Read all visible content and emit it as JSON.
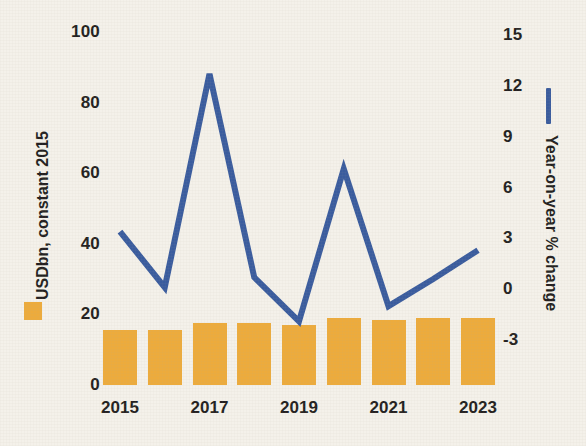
{
  "chart_data": {
    "type": "bar",
    "title": "",
    "subtitle": "",
    "xlabel": "",
    "categories": [
      "2015",
      "2016",
      "2017",
      "2018",
      "2019",
      "2020",
      "2021",
      "2022",
      "2023"
    ],
    "x_tick_labels": [
      "2015",
      "2017",
      "2019",
      "2021",
      "2023"
    ],
    "x_tick_categories": [
      "2015",
      "2017",
      "2019",
      "2021",
      "2023"
    ],
    "grid": false,
    "legend_position": "left-and-right-outside",
    "series": [
      {
        "name": "USDbn, constant 2015",
        "type": "bar",
        "axis": "left",
        "color": "#edab3c",
        "values": [
          15.5,
          15.5,
          17.5,
          17.5,
          17.0,
          19.0,
          18.5,
          19.0,
          19.0
        ]
      },
      {
        "name": "Year-on-year % change",
        "type": "line",
        "axis": "right",
        "color": "#3a5c9e",
        "values": [
          3.4,
          0.1,
          12.7,
          0.7,
          -1.9,
          7.1,
          -1.0,
          0.6,
          2.3
        ]
      }
    ],
    "left_axis": {
      "label": "USDbn, constant 2015",
      "ticks": [
        0,
        20,
        40,
        60,
        80,
        100
      ],
      "tick_labels": [
        "0",
        "20",
        "40",
        "60",
        "80",
        "100"
      ],
      "ylim": [
        0,
        100
      ]
    },
    "right_axis": {
      "label": "Year-on-year % change",
      "ticks": [
        -3,
        0,
        3,
        6,
        9,
        12,
        15
      ],
      "tick_labels": [
        "-3",
        "0",
        "3",
        "6",
        "9",
        "12",
        "15"
      ],
      "ylim": [
        -3,
        15
      ]
    },
    "background_color": "#f4f1ea"
  },
  "legend": {
    "bar_swatch_name": "bar-series-swatch",
    "line_swatch_name": "line-series-swatch"
  }
}
